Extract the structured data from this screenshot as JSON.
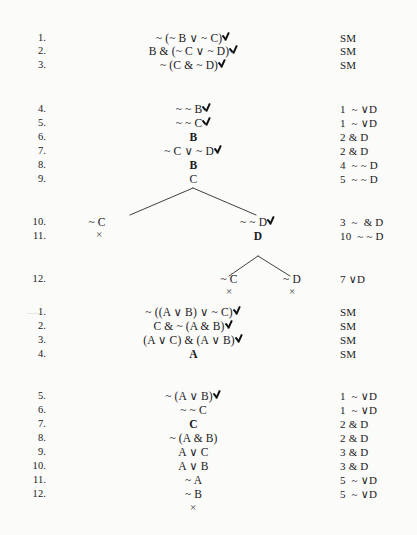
{
  "document": {
    "type": "truth-tree-proofs",
    "background_color": "#fbfbfa",
    "ink_color": "#1a1a1a"
  },
  "symbols": {
    "check": "check-mark",
    "close": "×"
  },
  "proofs": [
    {
      "id": "proof-1",
      "rows": [
        {
          "num": "1.",
          "formula": "~ (~ B ∨ ~ C)",
          "check": true,
          "just": "SM"
        },
        {
          "num": "2.",
          "formula": "B & (~ C ∨ ~ D)",
          "check": true,
          "just": "SM"
        },
        {
          "num": "3.",
          "formula": "~ (C & ~ D)",
          "check": true,
          "just": "SM"
        },
        {
          "num": "4.",
          "formula": "~ ~ B",
          "check": true,
          "just": "1  ~ ∨D"
        },
        {
          "num": "5.",
          "formula": "~ ~ C",
          "check": true,
          "just": "1  ~ ∨D"
        },
        {
          "num": "6.",
          "formula": "B",
          "check": false,
          "just": "2 & D"
        },
        {
          "num": "7.",
          "formula": "~ C ∨ ~ D",
          "check": true,
          "just": "2 & D"
        },
        {
          "num": "8.",
          "formula": "B",
          "check": false,
          "just": "4  ~ ~ D"
        },
        {
          "num": "9.",
          "formula": "C",
          "check": false,
          "just": "5  ~ ~ D"
        },
        {
          "num": "10.",
          "formula": "",
          "check": false,
          "just": "3  ~  & D"
        },
        {
          "num": "11.",
          "formula": "",
          "check": false,
          "just": "10  ~ ~ D"
        },
        {
          "num": "12.",
          "formula": "",
          "check": false,
          "just": "7 ∨D"
        }
      ],
      "tree_nodes": [
        {
          "label": "~ C",
          "check": false,
          "row": 10
        },
        {
          "label": "~ ~ D",
          "check": true,
          "row": 10
        },
        {
          "label": "D",
          "check": false,
          "row": 11
        },
        {
          "label": "~ C",
          "check": false,
          "row": 12
        },
        {
          "label": "~ D",
          "check": false,
          "row": 12
        }
      ],
      "closures": 4
    },
    {
      "id": "proof-2",
      "rows": [
        {
          "num": "1.",
          "formula": "~ ((A ∨ B) ∨ ~ C)",
          "check": true,
          "just": "SM"
        },
        {
          "num": "2.",
          "formula": "C & ~ (A & B)",
          "check": true,
          "just": "SM"
        },
        {
          "num": "3.",
          "formula": "(A ∨ C) & (A ∨ B)",
          "check": true,
          "just": "SM"
        },
        {
          "num": "4.",
          "formula": "A",
          "check": false,
          "just": "SM"
        },
        {
          "num": "5.",
          "formula": "~ (A ∨ B)",
          "check": true,
          "just": "1  ~ ∨D"
        },
        {
          "num": "6.",
          "formula": "~ ~ C",
          "check": false,
          "just": "1  ~ ∨D"
        },
        {
          "num": "7.",
          "formula": "C",
          "check": false,
          "just": "2 & D"
        },
        {
          "num": "8.",
          "formula": "~ (A & B)",
          "check": false,
          "just": "2 & D"
        },
        {
          "num": "9.",
          "formula": "A ∨ C",
          "check": false,
          "just": "3 & D"
        },
        {
          "num": "10.",
          "formula": "A ∨ B",
          "check": false,
          "just": "3 & D"
        },
        {
          "num": "11.",
          "formula": "~ A",
          "check": false,
          "just": "5  ~ ∨D"
        },
        {
          "num": "12.",
          "formula": "~ B",
          "check": false,
          "just": "5  ~ ∨D"
        }
      ],
      "closures": 1
    }
  ]
}
